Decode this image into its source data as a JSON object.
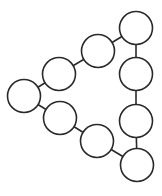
{
  "diagram": {
    "type": "node-link-graph",
    "colors": {
      "background": "#ffffff",
      "stroke": "#2a2a2a",
      "fill": "#ffffff"
    },
    "node_radius": 16.5,
    "stroke_width": 1.6,
    "nodes": [
      {
        "id": "n1",
        "label": "",
        "cx": 136,
        "cy": 28
      },
      {
        "id": "n2",
        "label": "",
        "cx": 98,
        "cy": 51
      },
      {
        "id": "n3",
        "label": "",
        "cx": 59,
        "cy": 74
      },
      {
        "id": "n4",
        "label": "",
        "cx": 24,
        "cy": 96
      },
      {
        "id": "n5",
        "label": "",
        "cx": 60,
        "cy": 118
      },
      {
        "id": "n6",
        "label": "",
        "cx": 97,
        "cy": 141
      },
      {
        "id": "n7",
        "label": "",
        "cx": 137,
        "cy": 165
      },
      {
        "id": "n8",
        "label": "",
        "cx": 136,
        "cy": 74
      },
      {
        "id": "n9",
        "label": "",
        "cx": 136,
        "cy": 121
      }
    ],
    "edges": [
      {
        "from": "n1",
        "to": "n2"
      },
      {
        "from": "n2",
        "to": "n3"
      },
      {
        "from": "n3",
        "to": "n4"
      },
      {
        "from": "n4",
        "to": "n5"
      },
      {
        "from": "n5",
        "to": "n6"
      },
      {
        "from": "n6",
        "to": "n7"
      },
      {
        "from": "n1",
        "to": "n8"
      },
      {
        "from": "n8",
        "to": "n9"
      },
      {
        "from": "n9",
        "to": "n7"
      }
    ]
  }
}
